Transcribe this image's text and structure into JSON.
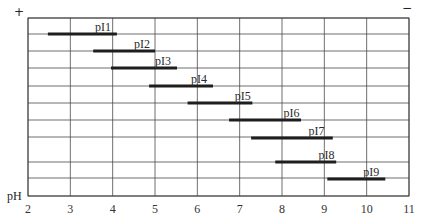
{
  "chart_data": {
    "type": "range-bar",
    "title": "",
    "xlabel": "pH",
    "ylabel": "",
    "xlim": [
      2,
      11
    ],
    "x_ticks": [
      2,
      3,
      4,
      5,
      6,
      7,
      8,
      9,
      10,
      11
    ],
    "grid": true,
    "top_left_marker": "+",
    "top_right_marker": "−",
    "series": [
      {
        "name": "pI1",
        "start": 2.47,
        "end": 4.1
      },
      {
        "name": "pI2",
        "start": 3.54,
        "end": 5.0
      },
      {
        "name": "pI3",
        "start": 3.96,
        "end": 5.52
      },
      {
        "name": "pI4",
        "start": 4.86,
        "end": 6.37
      },
      {
        "name": "pI5",
        "start": 5.77,
        "end": 7.3
      },
      {
        "name": "pI6",
        "start": 6.75,
        "end": 8.45
      },
      {
        "name": "pI7",
        "start": 7.27,
        "end": 9.2
      },
      {
        "name": "pI8",
        "start": 7.84,
        "end": 9.28
      },
      {
        "name": "pI9",
        "start": 9.07,
        "end": 10.44
      }
    ]
  },
  "layout": {
    "plot_left": 28,
    "plot_right": 409,
    "plot_top": 18,
    "plot_bottom": 196,
    "row_lines": [
      18,
      34,
      51,
      68,
      86,
      103,
      120,
      137,
      162,
      178,
      196
    ],
    "bar_rows": [
      34,
      51,
      68,
      86,
      103,
      120,
      138,
      162,
      179
    ],
    "label_offsets": [
      1.0,
      0.95,
      1.0,
      1.0,
      0.8,
      0.8,
      1.1,
      0.8,
      1.0
    ]
  }
}
